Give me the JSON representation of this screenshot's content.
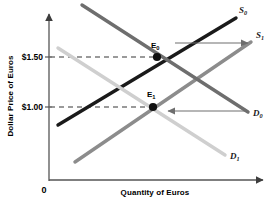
{
  "chart_data": {
    "type": "line",
    "title": "",
    "xlabel": "Quantity of Euros",
    "ylabel": "Dollar Price of Euros",
    "origin_label": "0",
    "grid": false,
    "legend": "inline-curve-labels",
    "ytick_labels": [
      "$1.50",
      "$1.00"
    ],
    "ytick_values": [
      1.5,
      1.0
    ],
    "xtick_labels": [],
    "series": [
      {
        "name": "S_0",
        "label_main": "S",
        "label_sub": "0",
        "kind": "supply",
        "color": "#1a1a1a",
        "points": [
          [
            58,
            125
          ],
          [
            236,
            18
          ]
        ],
        "label_pos": [
          239,
          13
        ]
      },
      {
        "name": "S_1",
        "label_main": "S",
        "label_sub": "1",
        "kind": "supply",
        "color": "#8c8c8c",
        "points": [
          [
            75,
            162
          ],
          [
            251,
            42
          ]
        ],
        "label_pos": [
          256,
          38
        ]
      },
      {
        "name": "D_0",
        "label_main": "D",
        "label_sub": "0",
        "kind": "demand",
        "color": "#6e6e6e",
        "points": [
          [
            82,
            5
          ],
          [
            248,
            112
          ]
        ],
        "label_pos": [
          253,
          116
        ]
      },
      {
        "name": "D_1",
        "label_main": "D",
        "label_sub": "1",
        "kind": "demand",
        "color": "#cfcfcf",
        "points": [
          [
            58,
            48
          ],
          [
            225,
            155
          ]
        ],
        "label_pos": [
          230,
          159
        ]
      }
    ],
    "equilibria": [
      {
        "name": "E_0",
        "label_main": "E",
        "label_sub": "0",
        "price": "$1.50",
        "x": 157,
        "y": 57,
        "label_pos": [
          151,
          48
        ]
      },
      {
        "name": "E_1",
        "label_main": "E",
        "label_sub": "1",
        "price": "$1.00",
        "x": 153,
        "y": 107,
        "label_pos": [
          147,
          97
        ]
      }
    ],
    "shift_arrows": [
      {
        "name": "supply-shift-arrow",
        "direction": "right",
        "from": [
          175,
          43
        ],
        "to": [
          248,
          43
        ],
        "color": "#6e6e6e"
      },
      {
        "name": "demand-shift-arrow",
        "direction": "left",
        "from": [
          245,
          111
        ],
        "to": [
          168,
          111
        ],
        "color": "#6e6e6e"
      }
    ],
    "dashed_guides": [
      {
        "name": "price-guide-150",
        "from": [
          50,
          57
        ],
        "to": [
          157,
          57
        ]
      },
      {
        "name": "price-guide-100",
        "from": [
          50,
          107
        ],
        "to": [
          153,
          107
        ]
      }
    ],
    "axes": {
      "y_axis": {
        "x": 49,
        "y_top": 12,
        "y_bottom": 181
      },
      "x_axis": {
        "y": 180,
        "x_left": 49,
        "x_right": 266
      },
      "color": "#555555"
    }
  }
}
